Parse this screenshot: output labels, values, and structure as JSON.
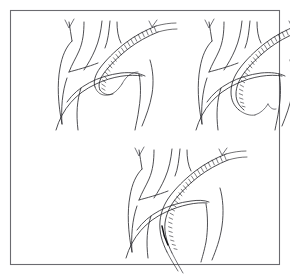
{
  "figure": {
    "caption": "",
    "background_color": "#ffffff",
    "frame": {
      "name": "outer-frame",
      "x": 10,
      "y": 10,
      "width": 270,
      "height": 255,
      "stroke_color": "#6b6b70",
      "stroke_width": 1.1
    },
    "line_color": "#2e2e33",
    "device_color": "#15151a",
    "panel_count": 3,
    "panel_layout": "two-on-top-one-below-centered"
  },
  "panels": [
    {
      "id": "panel-a",
      "label": "",
      "position": "top-left",
      "origin_x": 18,
      "origin_y": 14,
      "scale": 1.0,
      "stage": "catheter tip positioned at arch, proximal curve only",
      "device_advance_fraction": 0.35,
      "anatomy": [
        "ascending aorta",
        "aortic arch",
        "brachiocephalic trunk",
        "left common carotid artery",
        "left subclavian artery",
        "vertebral artery notch",
        "descending aorta"
      ],
      "device": "braided stent-graft on delivery catheter"
    },
    {
      "id": "panel-b",
      "label": "",
      "position": "top-right",
      "origin_x": 158,
      "origin_y": 14,
      "scale": 1.0,
      "stage": "device advanced around arch into proximal descending aorta",
      "device_advance_fraction": 0.65,
      "anatomy": [
        "ascending aorta",
        "aortic arch",
        "brachiocephalic trunk",
        "left common carotid artery",
        "left subclavian artery",
        "vertebral artery notch",
        "descending aorta"
      ],
      "device": "braided stent-graft on delivery catheter"
    },
    {
      "id": "panel-c",
      "label": "",
      "position": "bottom-center",
      "origin_x": 88,
      "origin_y": 142,
      "scale": 1.0,
      "stage": "device fully advanced deep into descending aorta",
      "device_advance_fraction": 1.0,
      "anatomy": [
        "ascending aorta",
        "aortic arch",
        "brachiocephalic trunk",
        "left common carotid artery",
        "left subclavian artery",
        "vertebral artery notch",
        "descending aorta"
      ],
      "device": "braided stent-graft on delivery catheter"
    }
  ]
}
